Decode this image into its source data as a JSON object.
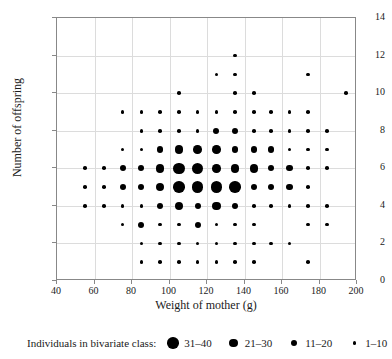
{
  "chart_data": {
    "type": "scatter",
    "title": "",
    "xlabel": "Weight of mother (g)",
    "ylabel": "Number of offspring",
    "xlim": [
      40,
      200
    ],
    "ylim": [
      0,
      14
    ],
    "xticks": [
      40,
      60,
      80,
      100,
      120,
      140,
      160,
      180,
      200
    ],
    "yticks": [
      0,
      2,
      4,
      6,
      8,
      10,
      12,
      14
    ],
    "grid": true,
    "legend_position": "below",
    "legend_caption": "Individuals in bivariate class:",
    "size_classes": [
      {
        "label": "31–40",
        "min": 31,
        "max": 40,
        "diameter_px": 11.5
      },
      {
        "label": "21–30",
        "min": 21,
        "max": 30,
        "diameter_px": 8.5
      },
      {
        "label": "11–20",
        "min": 11,
        "max": 20,
        "diameter_px": 6.2
      },
      {
        "label": "1–10",
        "min": 1,
        "max": 10,
        "diameter_px": 3.6
      }
    ],
    "points": [
      {
        "x": 135,
        "y": 12,
        "cls": 3
      },
      {
        "x": 125,
        "y": 11,
        "cls": 3
      },
      {
        "x": 135,
        "y": 11,
        "cls": 3
      },
      {
        "x": 174,
        "y": 11,
        "cls": 3
      },
      {
        "x": 105,
        "y": 10,
        "cls": 3
      },
      {
        "x": 135,
        "y": 10,
        "cls": 3
      },
      {
        "x": 145,
        "y": 10,
        "cls": 3
      },
      {
        "x": 194,
        "y": 10,
        "cls": 3
      },
      {
        "x": 75,
        "y": 9,
        "cls": 3
      },
      {
        "x": 85,
        "y": 9,
        "cls": 3
      },
      {
        "x": 95,
        "y": 9,
        "cls": 3
      },
      {
        "x": 105,
        "y": 9,
        "cls": 3
      },
      {
        "x": 115,
        "y": 9,
        "cls": 3
      },
      {
        "x": 125,
        "y": 9,
        "cls": 3
      },
      {
        "x": 135,
        "y": 9,
        "cls": 3
      },
      {
        "x": 145,
        "y": 9,
        "cls": 3
      },
      {
        "x": 154,
        "y": 9,
        "cls": 3
      },
      {
        "x": 164,
        "y": 9,
        "cls": 3
      },
      {
        "x": 174,
        "y": 9,
        "cls": 3
      },
      {
        "x": 85,
        "y": 8,
        "cls": 3
      },
      {
        "x": 95,
        "y": 8,
        "cls": 3
      },
      {
        "x": 105,
        "y": 8,
        "cls": 3
      },
      {
        "x": 115,
        "y": 8,
        "cls": 3
      },
      {
        "x": 125,
        "y": 8,
        "cls": 2
      },
      {
        "x": 135,
        "y": 8,
        "cls": 2
      },
      {
        "x": 145,
        "y": 8,
        "cls": 3
      },
      {
        "x": 154,
        "y": 8,
        "cls": 3
      },
      {
        "x": 164,
        "y": 8,
        "cls": 3
      },
      {
        "x": 174,
        "y": 8,
        "cls": 3
      },
      {
        "x": 184,
        "y": 8,
        "cls": 3
      },
      {
        "x": 75,
        "y": 7,
        "cls": 3
      },
      {
        "x": 85,
        "y": 7,
        "cls": 3
      },
      {
        "x": 95,
        "y": 7,
        "cls": 2
      },
      {
        "x": 105,
        "y": 7,
        "cls": 1
      },
      {
        "x": 115,
        "y": 7,
        "cls": 1
      },
      {
        "x": 125,
        "y": 7,
        "cls": 1
      },
      {
        "x": 135,
        "y": 7,
        "cls": 2
      },
      {
        "x": 145,
        "y": 7,
        "cls": 2
      },
      {
        "x": 154,
        "y": 7,
        "cls": 2
      },
      {
        "x": 164,
        "y": 7,
        "cls": 3
      },
      {
        "x": 174,
        "y": 7,
        "cls": 3
      },
      {
        "x": 184,
        "y": 7,
        "cls": 3
      },
      {
        "x": 55,
        "y": 6,
        "cls": 3
      },
      {
        "x": 65,
        "y": 6,
        "cls": 3
      },
      {
        "x": 75,
        "y": 6,
        "cls": 2
      },
      {
        "x": 85,
        "y": 6,
        "cls": 2
      },
      {
        "x": 95,
        "y": 6,
        "cls": 1
      },
      {
        "x": 105,
        "y": 6,
        "cls": 0
      },
      {
        "x": 115,
        "y": 6,
        "cls": 0
      },
      {
        "x": 125,
        "y": 6,
        "cls": 1
      },
      {
        "x": 135,
        "y": 6,
        "cls": 1
      },
      {
        "x": 145,
        "y": 6,
        "cls": 1
      },
      {
        "x": 154,
        "y": 6,
        "cls": 2
      },
      {
        "x": 164,
        "y": 6,
        "cls": 2
      },
      {
        "x": 174,
        "y": 6,
        "cls": 3
      },
      {
        "x": 184,
        "y": 6,
        "cls": 3
      },
      {
        "x": 55,
        "y": 5,
        "cls": 3
      },
      {
        "x": 65,
        "y": 5,
        "cls": 3
      },
      {
        "x": 75,
        "y": 5,
        "cls": 2
      },
      {
        "x": 85,
        "y": 5,
        "cls": 2
      },
      {
        "x": 95,
        "y": 5,
        "cls": 1
      },
      {
        "x": 105,
        "y": 5,
        "cls": 0
      },
      {
        "x": 115,
        "y": 5,
        "cls": 0
      },
      {
        "x": 125,
        "y": 5,
        "cls": 0
      },
      {
        "x": 135,
        "y": 5,
        "cls": 0
      },
      {
        "x": 145,
        "y": 5,
        "cls": 2
      },
      {
        "x": 154,
        "y": 5,
        "cls": 2
      },
      {
        "x": 164,
        "y": 5,
        "cls": 2
      },
      {
        "x": 174,
        "y": 5,
        "cls": 3
      },
      {
        "x": 55,
        "y": 4,
        "cls": 3
      },
      {
        "x": 65,
        "y": 4,
        "cls": 3
      },
      {
        "x": 75,
        "y": 4,
        "cls": 3
      },
      {
        "x": 85,
        "y": 4,
        "cls": 3
      },
      {
        "x": 95,
        "y": 4,
        "cls": 2
      },
      {
        "x": 105,
        "y": 4,
        "cls": 1
      },
      {
        "x": 115,
        "y": 4,
        "cls": 2
      },
      {
        "x": 125,
        "y": 4,
        "cls": 1
      },
      {
        "x": 135,
        "y": 4,
        "cls": 2
      },
      {
        "x": 145,
        "y": 4,
        "cls": 3
      },
      {
        "x": 154,
        "y": 4,
        "cls": 3
      },
      {
        "x": 164,
        "y": 4,
        "cls": 3
      },
      {
        "x": 174,
        "y": 4,
        "cls": 3
      },
      {
        "x": 184,
        "y": 4,
        "cls": 3
      },
      {
        "x": 75,
        "y": 3,
        "cls": 3
      },
      {
        "x": 85,
        "y": 3,
        "cls": 2
      },
      {
        "x": 95,
        "y": 3,
        "cls": 3
      },
      {
        "x": 105,
        "y": 3,
        "cls": 3
      },
      {
        "x": 115,
        "y": 3,
        "cls": 2
      },
      {
        "x": 125,
        "y": 3,
        "cls": 3
      },
      {
        "x": 135,
        "y": 3,
        "cls": 3
      },
      {
        "x": 145,
        "y": 3,
        "cls": 3
      },
      {
        "x": 174,
        "y": 3,
        "cls": 3
      },
      {
        "x": 184,
        "y": 3,
        "cls": 3
      },
      {
        "x": 85,
        "y": 2,
        "cls": 3
      },
      {
        "x": 95,
        "y": 2,
        "cls": 3
      },
      {
        "x": 105,
        "y": 2,
        "cls": 3
      },
      {
        "x": 115,
        "y": 2,
        "cls": 3
      },
      {
        "x": 125,
        "y": 2,
        "cls": 3
      },
      {
        "x": 135,
        "y": 2,
        "cls": 3
      },
      {
        "x": 145,
        "y": 2,
        "cls": 3
      },
      {
        "x": 154,
        "y": 2,
        "cls": 3
      },
      {
        "x": 164,
        "y": 2,
        "cls": 3
      },
      {
        "x": 85,
        "y": 1,
        "cls": 3
      },
      {
        "x": 95,
        "y": 1,
        "cls": 3
      },
      {
        "x": 105,
        "y": 1,
        "cls": 3
      },
      {
        "x": 115,
        "y": 1,
        "cls": 3
      },
      {
        "x": 125,
        "y": 1,
        "cls": 3
      },
      {
        "x": 135,
        "y": 1,
        "cls": 3
      },
      {
        "x": 145,
        "y": 1,
        "cls": 3
      },
      {
        "x": 174,
        "y": 1,
        "cls": 3
      }
    ]
  }
}
